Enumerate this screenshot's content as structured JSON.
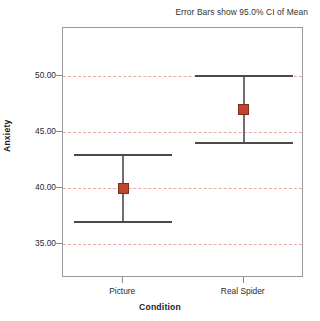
{
  "chart_data": {
    "type": "scatter",
    "title": "",
    "annotation": "Error Bars show 95.0% CI of Mean",
    "xlabel": "Condition",
    "ylabel": "Anxiety",
    "categories": [
      "Picture",
      "Real Spider"
    ],
    "values": [
      40.0,
      47.0
    ],
    "error_low": [
      37.0,
      44.0
    ],
    "error_high": [
      43.0,
      50.0
    ],
    "series": [
      {
        "name": "Mean Anxiety",
        "points": [
          {
            "category": "Picture",
            "mean": 40.0,
            "ci_lower": 37.0,
            "ci_upper": 43.0
          },
          {
            "category": "Real Spider",
            "mean": 47.0,
            "ci_lower": 44.0,
            "ci_upper": 50.0
          }
        ]
      }
    ],
    "ylim": [
      32.0,
      54.3
    ],
    "yticks": [
      35.0,
      40.0,
      45.0,
      50.0
    ],
    "ytick_labels": [
      "35.00",
      "40.00",
      "45.00",
      "50.00"
    ],
    "grid": true,
    "grid_axis": "y",
    "grid_style": "dashed",
    "legend": "none",
    "error_bar_type": "95% CI of Mean",
    "marker": "square",
    "colors": {
      "marker_fill": "#c0452f",
      "marker_border": "#7d2b1d",
      "error_bar": "#6f6f6f",
      "gridline": "#e8a9a4",
      "frame": "#9a9a9a",
      "text": "#2b2b2b"
    }
  },
  "axes": {
    "y_title": "Anxiety",
    "x_title": "Condition",
    "y_ticks": [
      {
        "label": "50.00",
        "value": 50.0
      },
      {
        "label": "45.00",
        "value": 45.0
      },
      {
        "label": "40.00",
        "value": 40.0
      },
      {
        "label": "35.00",
        "value": 35.0
      }
    ],
    "x_ticks": [
      {
        "label": "Picture"
      },
      {
        "label": "Real Spider"
      }
    ]
  },
  "caption": {
    "text": "Error Bars show 95.0% CI of Mean"
  }
}
